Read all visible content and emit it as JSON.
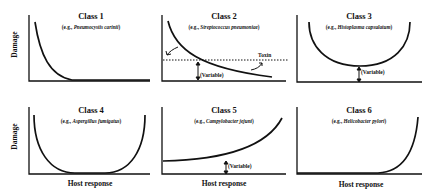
{
  "figure": {
    "y_axis_label": "Damage",
    "x_axis_label": "Host response",
    "panels": [
      {
        "title": "Class 1",
        "example_prefix": "(e.g., ",
        "example_organism": "Pneumocystis carinii",
        "example_suffix": ")",
        "curve": "decreasing to baseline"
      },
      {
        "title": "Class 2",
        "example_prefix": "(e.g., ",
        "example_organism": "Streptococcus pneumoniae",
        "example_suffix": ")",
        "curve": "decreasing, crosses toxin threshold",
        "annotations": {
          "toxin": "Toxin",
          "variable": "(Variable)"
        }
      },
      {
        "title": "Class 3",
        "example_prefix": "(e.g., ",
        "example_organism": "Histoplasma capsulatum",
        "example_suffix": ")",
        "curve": "U-shaped, raised minimum",
        "annotations": {
          "variable": "(Variable)"
        }
      },
      {
        "title": "Class 4",
        "example_prefix": "(e.g., ",
        "example_organism": "Aspergillus fumigatus",
        "example_suffix": ")",
        "curve": "U-shaped, minimum at baseline"
      },
      {
        "title": "Class 5",
        "example_prefix": "(e.g., ",
        "example_organism": "Campylobacter jejuni",
        "example_suffix": ")",
        "curve": "increasing from raised baseline",
        "annotations": {
          "variable": "(Variable)"
        }
      },
      {
        "title": "Class 6",
        "example_prefix": "(e.g., ",
        "example_organism": "Helicobacter pylori",
        "example_suffix": ")",
        "curve": "flat then sharply increasing"
      }
    ]
  }
}
